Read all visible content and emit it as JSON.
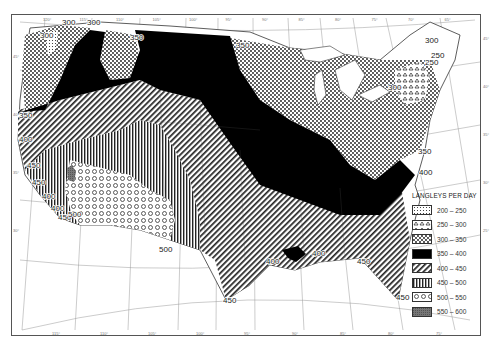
{
  "map": {
    "subject": "Mean daily solar radiation, United States",
    "legend": {
      "title": "LANGLEYS PER DAY",
      "items": [
        {
          "range": "200 – 250",
          "pattern": "fine-grid-dots"
        },
        {
          "range": "250 – 300",
          "pattern": "triangles"
        },
        {
          "range": "300 – 350",
          "pattern": "dots"
        },
        {
          "range": "350 – 400",
          "pattern": "solid-black"
        },
        {
          "range": "400 – 450",
          "pattern": "diagonal-hatch"
        },
        {
          "range": "450 – 500",
          "pattern": "vertical-hatch"
        },
        {
          "range": "500 – 550",
          "pattern": "circles"
        },
        {
          "range": "550 – 600",
          "pattern": "dense-gray"
        }
      ]
    },
    "isoline_labels": [
      {
        "text": "300",
        "x": 62,
        "y": 25
      },
      {
        "text": "300",
        "x": 87,
        "y": 25
      },
      {
        "text": "300",
        "x": 40,
        "y": 38
      },
      {
        "text": "350",
        "x": 130,
        "y": 40
      },
      {
        "text": "350",
        "x": 236,
        "y": 48
      },
      {
        "text": "300",
        "x": 425,
        "y": 43
      },
      {
        "text": "250",
        "x": 431,
        "y": 58
      },
      {
        "text": "250",
        "x": 425,
        "y": 65
      },
      {
        "text": "300",
        "x": 388,
        "y": 90
      },
      {
        "text": "350",
        "x": 19,
        "y": 118
      },
      {
        "text": "400",
        "x": 19,
        "y": 142
      },
      {
        "text": "450",
        "x": 27,
        "y": 168
      },
      {
        "text": "450",
        "x": 32,
        "y": 185
      },
      {
        "text": "400",
        "x": 42,
        "y": 199
      },
      {
        "text": "400",
        "x": 51,
        "y": 211
      },
      {
        "text": "450",
        "x": 58,
        "y": 220
      },
      {
        "text": "500",
        "x": 68,
        "y": 217
      },
      {
        "text": "500",
        "x": 159,
        "y": 252
      },
      {
        "text": "350",
        "x": 418,
        "y": 154
      },
      {
        "text": "400",
        "x": 419,
        "y": 175
      },
      {
        "text": "400",
        "x": 266,
        "y": 264
      },
      {
        "text": "400",
        "x": 312,
        "y": 256
      },
      {
        "text": "450",
        "x": 357,
        "y": 264
      },
      {
        "text": "450",
        "x": 223,
        "y": 303
      },
      {
        "text": "450",
        "x": 396,
        "y": 300
      }
    ],
    "graticule": {
      "top_longitudes": [
        "120°",
        "115°",
        "110°",
        "105°",
        "100°",
        "95°",
        "90°",
        "85°",
        "80°",
        "75°",
        "70°",
        "65°"
      ],
      "bottom_longitudes": [
        "115°",
        "110°",
        "105°",
        "100°",
        "95°",
        "90°",
        "85°",
        "80°",
        "75°"
      ],
      "left_latitudes": [
        "45°",
        "40°",
        "35°",
        "30°"
      ],
      "right_latitudes": [
        "45°",
        "40°",
        "35°",
        "30°",
        "25°"
      ]
    }
  }
}
